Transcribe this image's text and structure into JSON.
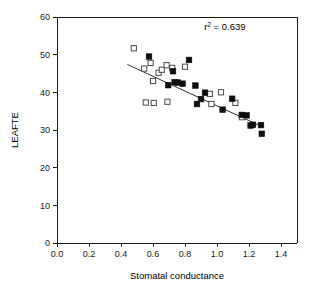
{
  "chart_data": {
    "type": "scatter",
    "title": "",
    "xlabel": "Stomatal conductance",
    "ylabel": "LEAFTE",
    "xlim": [
      0.0,
      1.5
    ],
    "ylim": [
      0,
      60
    ],
    "xticks": [
      "0.0",
      "0.2",
      "0.4",
      "0.6",
      "0.8",
      "1.0",
      "1.2",
      "1.4"
    ],
    "xtick_values": [
      0.0,
      0.2,
      0.4,
      0.6,
      0.8,
      1.0,
      1.2,
      1.4
    ],
    "yticks": [
      "0",
      "10",
      "20",
      "30",
      "40",
      "50",
      "60"
    ],
    "ytick_values": [
      0,
      10,
      20,
      30,
      40,
      50,
      60
    ],
    "grid": false,
    "legend": "none",
    "annotations": [
      {
        "name": "r-squared-annotation",
        "prefix": "r",
        "superscript": "2",
        "suffix": " = 0.639",
        "x": 0.92,
        "y": 56.5
      }
    ],
    "series": [
      {
        "name": "Open squares",
        "marker": "open-square",
        "color": "#ffffff",
        "edge_color": "#4a4a4a",
        "points": [
          {
            "x": 0.48,
            "y": 51.7
          },
          {
            "x": 0.545,
            "y": 46.3
          },
          {
            "x": 0.555,
            "y": 37.3
          },
          {
            "x": 0.585,
            "y": 47.8
          },
          {
            "x": 0.6,
            "y": 43.0
          },
          {
            "x": 0.605,
            "y": 37.2
          },
          {
            "x": 0.635,
            "y": 45.2
          },
          {
            "x": 0.655,
            "y": 46.0
          },
          {
            "x": 0.685,
            "y": 47.2
          },
          {
            "x": 0.69,
            "y": 37.5
          },
          {
            "x": 0.72,
            "y": 46.5
          },
          {
            "x": 0.8,
            "y": 46.8
          },
          {
            "x": 0.955,
            "y": 39.6
          },
          {
            "x": 0.965,
            "y": 36.9
          },
          {
            "x": 1.025,
            "y": 40.0
          },
          {
            "x": 1.115,
            "y": 37.2
          },
          {
            "x": 1.155,
            "y": 33.4
          }
        ]
      },
      {
        "name": "Filled squares",
        "marker": "filled-square",
        "color": "#0d0d0d",
        "edge_color": "#0d0d0d",
        "points": [
          {
            "x": 0.575,
            "y": 49.5
          },
          {
            "x": 0.695,
            "y": 41.9
          },
          {
            "x": 0.725,
            "y": 45.6
          },
          {
            "x": 0.735,
            "y": 42.7
          },
          {
            "x": 0.755,
            "y": 42.6
          },
          {
            "x": 0.785,
            "y": 42.3
          },
          {
            "x": 0.825,
            "y": 48.6
          },
          {
            "x": 0.865,
            "y": 41.8
          },
          {
            "x": 0.875,
            "y": 36.9
          },
          {
            "x": 0.9,
            "y": 38.2
          },
          {
            "x": 0.925,
            "y": 39.9
          },
          {
            "x": 1.035,
            "y": 35.4
          },
          {
            "x": 1.095,
            "y": 38.3
          },
          {
            "x": 1.155,
            "y": 34.0
          },
          {
            "x": 1.185,
            "y": 33.9
          },
          {
            "x": 1.21,
            "y": 31.2
          },
          {
            "x": 1.225,
            "y": 31.4
          },
          {
            "x": 1.275,
            "y": 31.3
          },
          {
            "x": 1.28,
            "y": 29.0
          }
        ]
      }
    ],
    "fit_line": {
      "name": "regression-line",
      "x_start": 0.44,
      "y_start": 47.4,
      "x_end": 1.275,
      "y_end": 31.0
    }
  }
}
